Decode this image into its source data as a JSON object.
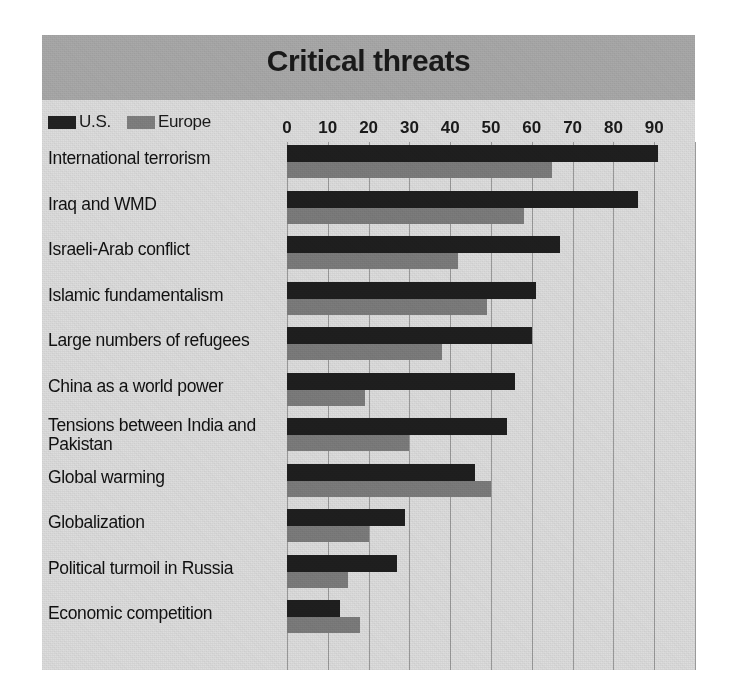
{
  "header": {
    "title": "Critical threats"
  },
  "legend": {
    "position": "top-left",
    "items": [
      {
        "label": "U.S.",
        "color": "#222222",
        "swatch": "us-swatch"
      },
      {
        "label": "Europe",
        "color": "#808080",
        "swatch": "europe-swatch"
      }
    ]
  },
  "axis": {
    "tick_labels": [
      "0",
      "10",
      "20",
      "30",
      "40",
      "50",
      "60",
      "70",
      "80",
      "90"
    ]
  },
  "chart_data": {
    "type": "bar",
    "orientation": "horizontal",
    "title": "Critical threats",
    "xlabel": "",
    "ylabel": "",
    "xlim": [
      0,
      100
    ],
    "xticks": [
      0,
      10,
      20,
      30,
      40,
      50,
      60,
      70,
      80,
      90
    ],
    "grid": true,
    "legend_position": "top-left",
    "categories": [
      "International terrorism",
      "Iraq and WMD",
      "Israeli-Arab conflict",
      "Islamic fundamentalism",
      "Large numbers of refugees",
      "China as a world power",
      "Tensions between India and Pakistan",
      "Global warming",
      "Globalization",
      "Political turmoil in Russia",
      "Economic competition"
    ],
    "series": [
      {
        "name": "U.S.",
        "color": "#1f1f1f",
        "values": [
          91,
          86,
          67,
          61,
          60,
          56,
          54,
          46,
          29,
          27,
          13
        ]
      },
      {
        "name": "Europe",
        "color": "#7c7c7c",
        "values": [
          65,
          58,
          42,
          49,
          38,
          19,
          30,
          50,
          20,
          15,
          18
        ]
      }
    ]
  },
  "colors": {
    "panel_background": "#dddddd",
    "header_background": "#a9a9a9",
    "us_bar": "#1f1f1f",
    "europe_bar": "#7c7c7c",
    "gridline": "#9a9a9a",
    "text": "#111111"
  }
}
